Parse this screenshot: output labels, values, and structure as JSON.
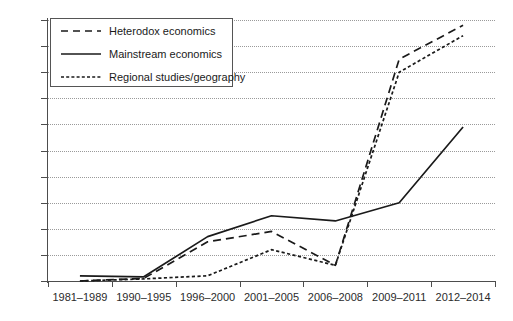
{
  "chart_data": {
    "type": "line",
    "title": "",
    "xlabel": "",
    "ylabel": "",
    "ylim": [
      0,
      50
    ],
    "yticks": [
      0,
      5,
      10,
      15,
      20,
      25,
      30,
      35,
      40,
      45,
      50
    ],
    "grid": true,
    "legend_position": "top-left",
    "categories": [
      "1981–1989",
      "1990–1995",
      "1996–2000",
      "2001–2005",
      "2006–2008",
      "2009–2011",
      "2012–2014"
    ],
    "series": [
      {
        "name": "Heterodox economics",
        "style": "dashed",
        "color": "#1a1a1a",
        "values": [
          0,
          0.5,
          7.5,
          9.5,
          3,
          42.5,
          49
        ]
      },
      {
        "name": "Mainstream economics",
        "style": "solid",
        "color": "#1a1a1a",
        "values": [
          1,
          0.8,
          8.5,
          12.5,
          11.5,
          15,
          29.5
        ]
      },
      {
        "name": "Regional studies/geography",
        "style": "dotted",
        "color": "#1a1a1a",
        "values": [
          0,
          0.4,
          1,
          6,
          3,
          40,
          47
        ]
      }
    ]
  },
  "legend": {
    "items": [
      {
        "label": "Heterodox economics",
        "swatch": "dashed-line-swatch"
      },
      {
        "label": "Mainstream economics",
        "swatch": "solid-line-swatch"
      },
      {
        "label": "Regional studies/geography",
        "swatch": "dotted-line-swatch"
      }
    ]
  }
}
